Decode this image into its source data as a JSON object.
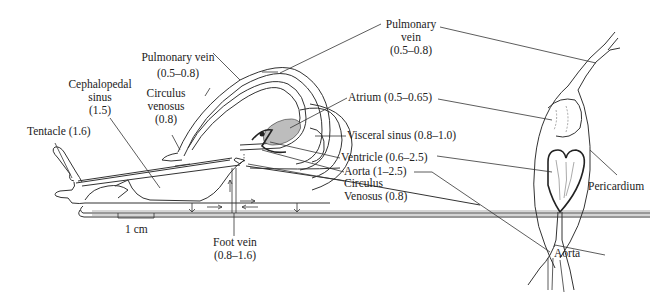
{
  "figure": {
    "colors": {
      "ink": "#333333",
      "background": "#ffffff",
      "shade": "#bdbdbd"
    }
  },
  "left_panel": {
    "labels": {
      "pulmonary_vein": {
        "name": "Pulmonary vein",
        "value": "(0.5–0.8)"
      },
      "cephalopedal_sinus": {
        "line1": "Cephalopedal",
        "line2": "sinus",
        "value": "(1.5)"
      },
      "circulus_venosus_top": {
        "line1": "Circulus",
        "line2": "venosus",
        "value": "(0.8)"
      },
      "tentacle": {
        "name": "Tentacle (1.6)"
      },
      "foot_vein": {
        "name": "Foot vein",
        "value": "(0.8–1.6)"
      },
      "scale_bar": {
        "text": "1 cm"
      }
    }
  },
  "center_labels": {
    "pulmonary_vein": {
      "line1": "Pulmonary",
      "line2": "vein",
      "value": "(0.5–0.8)"
    },
    "atrium": {
      "name": "Atrium (0.5–0.65)"
    },
    "visceral_sinus": {
      "name": "Visceral sinus (0.8–1.0)"
    },
    "ventricle": {
      "name": "Ventricle (0.6–2.5)"
    },
    "aorta": {
      "name": "Aorta (1–2.5)"
    },
    "circulus_venosus": {
      "line1": "Circulus",
      "line2": "Venosus (0.8)"
    }
  },
  "right_panel": {
    "labels": {
      "pericardium": {
        "name": "Pericardium"
      },
      "aorta": {
        "name": "Aorta"
      }
    }
  }
}
